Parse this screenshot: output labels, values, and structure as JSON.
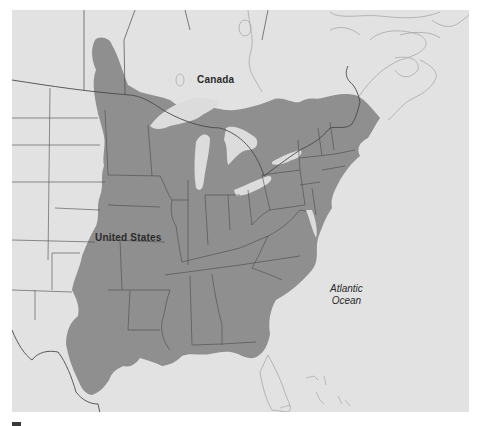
{
  "map": {
    "labels": {
      "canada": "Canada",
      "united_states": "United States",
      "ocean_line1": "Atlantic",
      "ocean_line2": "Ocean"
    },
    "colors": {
      "background": "#ffffff",
      "land_light": "#e2e2e2",
      "shaded_region": "#8f8f8f",
      "lakes": "#dcdcdc",
      "borders": "#4a4a4a",
      "coastline": "#a8a8a8"
    },
    "shaded_region_description": "Eastern United States and southern Ontario/Quebec highlighted in dark gray"
  }
}
